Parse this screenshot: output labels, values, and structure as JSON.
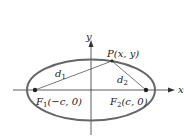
{
  "diagram": {
    "type": "ellipse-foci",
    "axes": {
      "x_label": "x",
      "y_label": "y"
    },
    "point": {
      "label": "P(x, y)"
    },
    "foci": [
      {
        "label": "F₁(−c, 0)",
        "name": "F1",
        "sub": "1",
        "coord": "(−c, 0)"
      },
      {
        "label": "F₂(c, 0)",
        "name": "F2",
        "sub": "2",
        "coord": "(c, 0)"
      }
    ],
    "distances": [
      {
        "label": "d₁",
        "base": "d",
        "sub": "1"
      },
      {
        "label": "d₂",
        "base": "d",
        "sub": "2"
      }
    ],
    "colors": {
      "ellipse": "#666666",
      "axes": "#333333",
      "lines": "#555555",
      "points": "#222222"
    }
  }
}
